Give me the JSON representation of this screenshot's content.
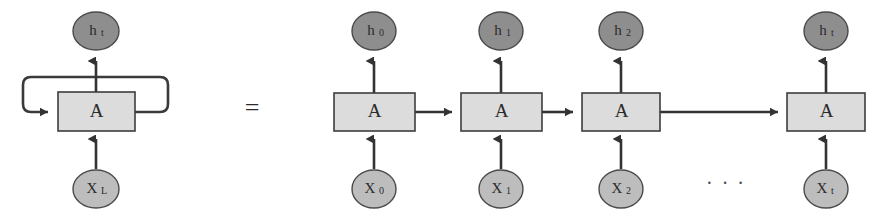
{
  "figure": {
    "type": "diagram",
    "background_color": "#ffffff",
    "equals_symbol": "=",
    "ellipsis_symbol": "· · ·"
  },
  "colors": {
    "hidden_node_fill": "#8e8e8e",
    "input_node_fill": "#bdbdbd",
    "cell_fill": "#dcdcdc",
    "stroke": "#333333",
    "text": "#2b2b2b"
  },
  "folded": {
    "cell_label": "A",
    "output_node": {
      "base": "h",
      "sub": "t",
      "full": "ht"
    },
    "input_node": {
      "base": "X",
      "sub": "L",
      "full": "XL"
    },
    "recurrent_loop": "self-loop"
  },
  "unrolled": {
    "steps": [
      {
        "cell_label": "A",
        "output_node": {
          "base": "h",
          "sub": "0",
          "full": "h0"
        },
        "input_node": {
          "base": "X",
          "sub": "0",
          "full": "X0"
        }
      },
      {
        "cell_label": "A",
        "output_node": {
          "base": "h",
          "sub": "1",
          "full": "h1"
        },
        "input_node": {
          "base": "X",
          "sub": "1",
          "full": "X1"
        }
      },
      {
        "cell_label": "A",
        "output_node": {
          "base": "h",
          "sub": "2",
          "full": "h2"
        },
        "input_node": {
          "base": "X",
          "sub": "2",
          "full": "X2"
        }
      },
      {
        "cell_label": "A",
        "output_node": {
          "base": "h",
          "sub": "t",
          "full": "ht"
        },
        "input_node": {
          "base": "X",
          "sub": "t",
          "full": "Xt"
        }
      }
    ]
  }
}
